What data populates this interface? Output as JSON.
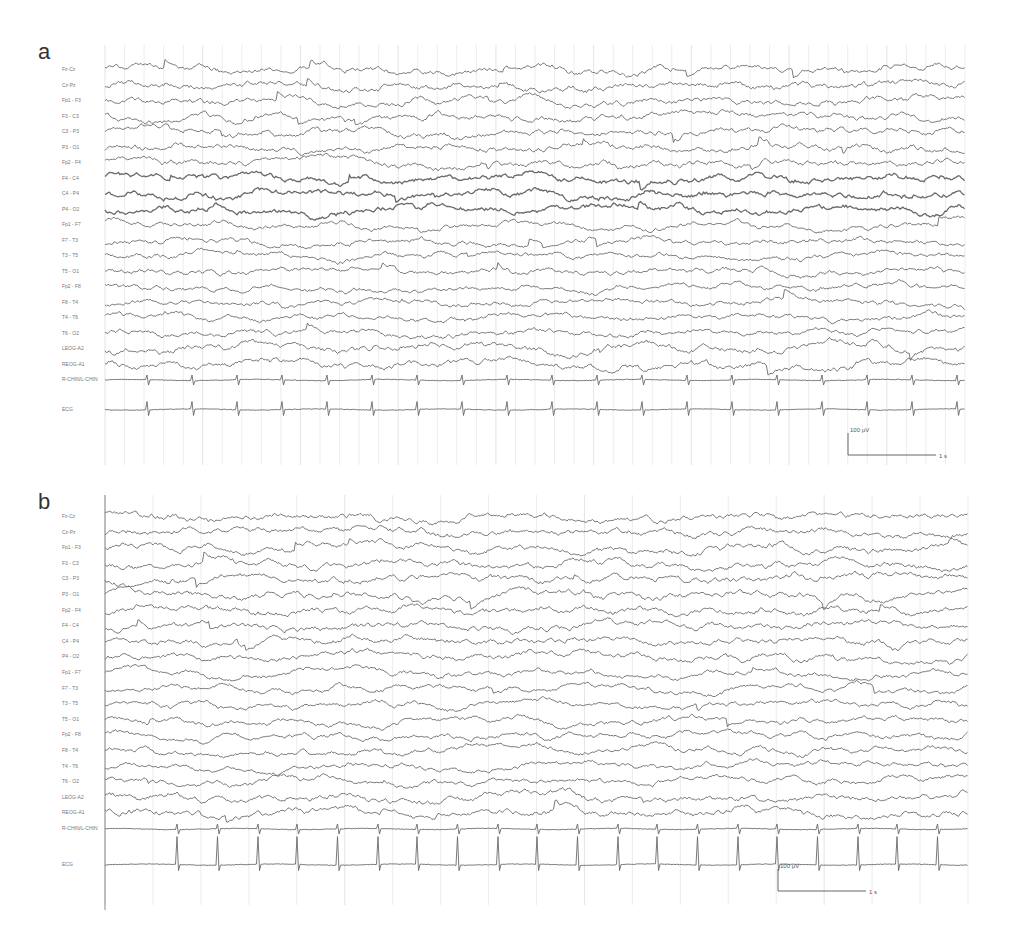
{
  "figure": {
    "panels": [
      {
        "letter": "a",
        "top": 45,
        "height": 430,
        "trace_left": 105,
        "trace_right": 965,
        "first_trace_y": 25,
        "channel_spacing": 15.5,
        "ecg_extra_gap": 14,
        "grid_count": 44,
        "left_border": false,
        "scale_bar": {
          "voltage": "100 µV",
          "time": "1 s",
          "x": 848,
          "y": 388
        },
        "seed": 11,
        "ecg_interval": 45,
        "ecg_offset": 42
      },
      {
        "letter": "b",
        "top": 495,
        "height": 420,
        "trace_left": 105,
        "trace_right": 968,
        "first_trace_y": 22,
        "channel_spacing": 15.6,
        "ecg_extra_gap": 20,
        "grid_count": 18,
        "left_border": true,
        "scale_bar": {
          "voltage": "100 µV",
          "time": "1 s",
          "x": 778,
          "y": 374
        },
        "seed": 37,
        "ecg_interval": 40,
        "ecg_offset": 72
      }
    ],
    "channels": [
      "Fz-Cz",
      "Cz-Pz",
      "Fp1 - F3",
      "F3 - C3",
      "C3 - P3",
      "P3 - O1",
      "Fp2 - F4",
      "F4 - C4",
      "C4 - P4",
      "P4 - O2",
      "Fp1 - F7",
      "F7 - T3",
      "T3 - T5",
      "T5 - O1",
      "Fp2 - F8",
      "F8 - T4",
      "T4 - T6",
      "T6 - O2",
      "LEOG-A2",
      "REOG-A1",
      "R-CHIN/L-CHIN",
      "ECG"
    ],
    "colors": {
      "trace": "#6a6a6a",
      "grid": "#e4e4e4",
      "label": "#777777",
      "border": "#888888"
    }
  }
}
